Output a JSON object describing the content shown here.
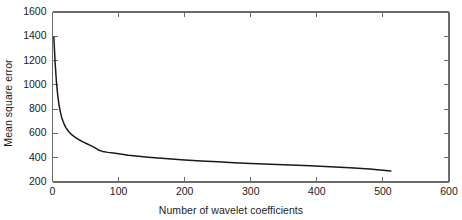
{
  "figure": {
    "background_color": "#ffffff",
    "line_color": "#1a1a1a",
    "axis_color": "#6b6b6b"
  },
  "chart_data": {
    "type": "line",
    "title": "",
    "xlabel": "Number of wavelet coefficients",
    "ylabel": "Mean square error",
    "xlim": [
      0,
      600
    ],
    "ylim": [
      200,
      1600
    ],
    "xticks": [
      0,
      100,
      200,
      300,
      400,
      500,
      600
    ],
    "yticks": [
      200,
      400,
      600,
      800,
      1000,
      1200,
      1400,
      1600
    ],
    "xtick_labels": [
      "0",
      "100",
      "200",
      "300",
      "400",
      "500",
      "600"
    ],
    "ytick_labels": [
      "200",
      "400",
      "600",
      "800",
      "1000",
      "1200",
      "1400",
      "1600"
    ],
    "grid": false,
    "legend": null,
    "series": [
      {
        "name": "Mean square error",
        "x": [
          2,
          4,
          6,
          8,
          10,
          12,
          14,
          16,
          18,
          20,
          24,
          28,
          32,
          36,
          40,
          46,
          52,
          58,
          64,
          70,
          76,
          84,
          92,
          100,
          115,
          130,
          145,
          160,
          180,
          200,
          225,
          250,
          275,
          300,
          330,
          360,
          390,
          420,
          450,
          480,
          512
        ],
        "y": [
          1395,
          1180,
          1020,
          910,
          830,
          775,
          730,
          700,
          672,
          650,
          618,
          595,
          578,
          562,
          548,
          530,
          515,
          500,
          483,
          462,
          452,
          444,
          438,
          432,
          421,
          412,
          404,
          397,
          389,
          382,
          373,
          366,
          359,
          353,
          346,
          340,
          333,
          326,
          318,
          307,
          291
        ]
      }
    ]
  }
}
